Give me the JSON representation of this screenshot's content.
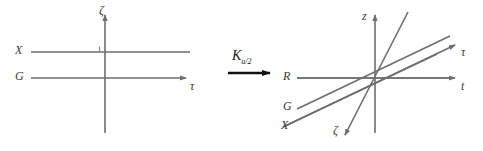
{
  "figure": {
    "type": "diagram",
    "stroke_color": "#6e6e6e",
    "arrow_color": "#111111",
    "text_color": "#3a3a3a",
    "background": "#ffffff"
  },
  "left_panel": {
    "name": "original-frame",
    "axes": [
      {
        "id": "zeta",
        "label": "ζ",
        "orientation": "vertical",
        "arrow": "up"
      },
      {
        "id": "tau",
        "label": "τ",
        "orientation": "horizontal",
        "arrow": "right"
      }
    ],
    "lines": [
      {
        "id": "X",
        "label": "X",
        "orientation": "horizontal",
        "arrow": "none"
      },
      {
        "id": "G",
        "label": "G",
        "orientation": "horizontal",
        "arrow": "right"
      }
    ],
    "tick": {
      "id": "zeta-tick",
      "label": ""
    }
  },
  "operator": {
    "name": "transformation-arrow",
    "symbol": "K",
    "subscript": "u/2",
    "full_label": "K u/2",
    "direction": "right"
  },
  "right_panel": {
    "name": "transformed-frame",
    "axes": [
      {
        "id": "z",
        "label": "z",
        "orientation": "vertical",
        "arrow": "up"
      },
      {
        "id": "t",
        "label": "t",
        "orientation": "horizontal",
        "arrow": "right"
      },
      {
        "id": "tau-prime",
        "label": "τ",
        "orientation": "slanted-up-right",
        "arrow": "up-right"
      },
      {
        "id": "zeta-prime",
        "label": "ζ",
        "orientation": "slanted-steep",
        "arrow": "down-left"
      }
    ],
    "lines": [
      {
        "id": "R",
        "label": "R",
        "orientation": "horizontal",
        "arrow": "none"
      },
      {
        "id": "G",
        "label": "G",
        "orientation": "slanted",
        "arrow": "none"
      },
      {
        "id": "X",
        "label": "X",
        "orientation": "slanted",
        "arrow": "none"
      }
    ]
  }
}
